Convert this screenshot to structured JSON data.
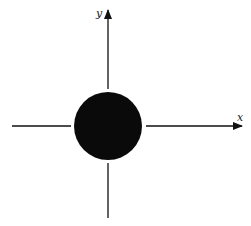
{
  "diagram": {
    "type": "coordinate-axes-with-disk",
    "colors": {
      "background": "#ffffff",
      "ink": "#111111",
      "disk": "#0a0a0a"
    },
    "axes": {
      "x": {
        "label": "x",
        "direction": "right",
        "has_arrow": true
      },
      "y": {
        "label": "y",
        "direction": "up",
        "has_arrow": true
      }
    },
    "disk": {
      "shape": "circle",
      "filled": true,
      "position": "origin"
    },
    "geometry": {
      "origin": [
        108,
        126
      ],
      "disk_radius": 34,
      "x_axis_left_segment": [
        12,
        71
      ],
      "x_axis_right_segment": [
        146,
        242
      ],
      "y_axis_top_segment": [
        10,
        89
      ],
      "y_axis_bottom_segment": [
        163,
        218
      ]
    }
  }
}
